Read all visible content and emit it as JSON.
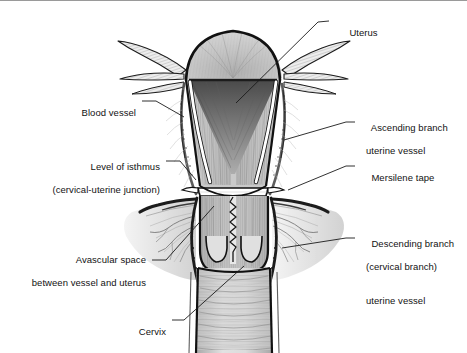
{
  "figure": {
    "type": "medical-anatomical-illustration",
    "style": "grayscale pen-and-ink stipple line drawing",
    "border": {
      "top_rule_color": "#9a9a9a"
    },
    "background": "#ffffff"
  },
  "labels": {
    "uterus": {
      "text": "Uterus",
      "side": "right"
    },
    "blood_vessel": {
      "text": "Blood vessel",
      "side": "left"
    },
    "ascending_branch": {
      "line1": "Ascending branch",
      "line2": "uterine vessel",
      "side": "right"
    },
    "level_of_isthmus": {
      "line1": "Level of isthmus",
      "line2": "(cervical-uterine junction)",
      "side": "left"
    },
    "mersilene_tape": {
      "text": "Mersilene tape",
      "side": "right"
    },
    "descending_branch": {
      "line1": "Descending branch",
      "line2": "(cervical branch)",
      "line3": "uterine vessel",
      "side": "right"
    },
    "avascular_space": {
      "line1": "Avascular space",
      "line2": "between vessel and uterus",
      "side": "left"
    },
    "cervix": {
      "text": "Cervix",
      "side": "left"
    }
  },
  "colors": {
    "ink": "#121212",
    "leader": "#1a1a1a",
    "tissue_light": "#d8d8d8",
    "tissue_mid": "#b4b4b4",
    "tissue_dark": "#8a8a8a",
    "tissue_deep": "#5a5a5a",
    "vessel_white": "#ffffff",
    "shadow": "#6e6e6e"
  }
}
